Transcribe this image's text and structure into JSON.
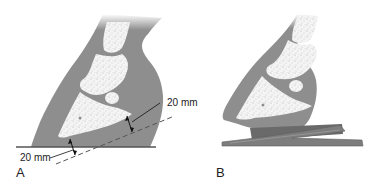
{
  "figure": {
    "panels": [
      {
        "id": "A",
        "label": "A",
        "description": "Hoof cross-section on flat ground showing 20 mm sole depth measurements",
        "annotations": [
          {
            "text": "20 mm",
            "position": "upper-right",
            "meaning": "distance from dorsal distal phalanx to hoof wall line"
          },
          {
            "text": "20 mm",
            "position": "lower-left",
            "meaning": "sole depth below tip of distal phalanx"
          }
        ]
      },
      {
        "id": "B",
        "label": "B",
        "description": "Hoof cross-section with wedge pad/shoe beneath"
      }
    ],
    "colors": {
      "hoof_tissue": "#8e8e8e",
      "bone": "#f4f4f4",
      "bone_speckle": "#b8b8b8",
      "ground_line": "#555555",
      "wedge": "#7d7d7d",
      "wedge_dark": "#5f5f5f",
      "text": "#222222"
    }
  }
}
